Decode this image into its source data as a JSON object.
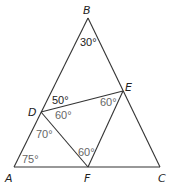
{
  "diagram": {
    "type": "geometry-triangle-with-inscribed-triangle",
    "vertices": {
      "A": {
        "label": "A",
        "x": 14,
        "y": 167
      },
      "B": {
        "label": "B",
        "x": 88,
        "y": 18
      },
      "C": {
        "label": "C",
        "x": 160,
        "y": 167
      },
      "D": {
        "label": "D",
        "x": 41,
        "y": 112
      },
      "E": {
        "label": "E",
        "x": 123,
        "y": 91
      },
      "F": {
        "label": "F",
        "x": 88,
        "y": 167
      }
    },
    "angles": [
      {
        "at": "B",
        "text": "30°",
        "value": 30
      },
      {
        "at": "D",
        "between": "BD-DE",
        "text": "50°",
        "value": 50
      },
      {
        "at": "D",
        "between": "ED-DF",
        "text": "60°",
        "value": 60
      },
      {
        "at": "D",
        "between": "FD-DA",
        "text": "70°",
        "value": 70
      },
      {
        "at": "E",
        "between": "DE-EF",
        "text": "60°",
        "value": 60
      },
      {
        "at": "F",
        "between": "DF-FE",
        "text": "60°",
        "value": 60
      },
      {
        "at": "A",
        "text": "75°",
        "value": 75
      }
    ],
    "segments": [
      "AB",
      "BC",
      "CA",
      "DE",
      "EF",
      "FD"
    ],
    "colors": {
      "line": "#333333",
      "vertex_label": "#222222",
      "angle_label": "#666666"
    }
  }
}
